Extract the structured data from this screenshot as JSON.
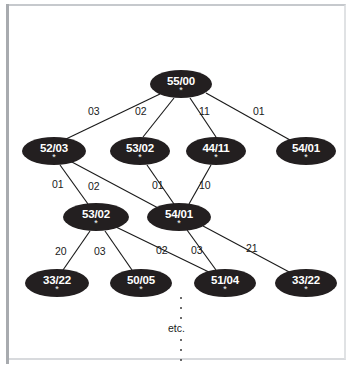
{
  "figure": {
    "type": "diagram",
    "subtype": "search-tree",
    "background_color": "#ffffff",
    "node_color": "#231f20",
    "node_text_color": "#ffffff",
    "edge_color": "#1a1a1a",
    "frame_color": "#b9bcc0"
  },
  "annotations": {
    "etc": "etc.",
    "node_marker": "*"
  },
  "nodes": [
    {
      "id": "n0",
      "label": "55/00",
      "marker": "*",
      "level": 0,
      "cx": 181,
      "cy": 84,
      "rx": 31,
      "ry": 14
    },
    {
      "id": "n1",
      "label": "52/03",
      "marker": "*",
      "level": 1,
      "cx": 54,
      "cy": 151,
      "rx": 32,
      "ry": 14
    },
    {
      "id": "n2",
      "label": "53/02",
      "marker": "*",
      "level": 1,
      "cx": 140,
      "cy": 151,
      "rx": 30,
      "ry": 14
    },
    {
      "id": "n3",
      "label": "44/11",
      "marker": "*",
      "level": 1,
      "cx": 216,
      "cy": 151,
      "rx": 30,
      "ry": 14
    },
    {
      "id": "n4",
      "label": "54/01",
      "marker": "*",
      "level": 1,
      "cx": 306,
      "cy": 151,
      "rx": 30,
      "ry": 14
    },
    {
      "id": "n5",
      "label": "53/02",
      "marker": "*",
      "level": 2,
      "cx": 96,
      "cy": 217,
      "rx": 33,
      "ry": 14
    },
    {
      "id": "n6",
      "label": "54/01",
      "marker": "*",
      "level": 2,
      "cx": 179,
      "cy": 217,
      "rx": 32,
      "ry": 14
    },
    {
      "id": "n7",
      "label": "33/22",
      "marker": "*",
      "level": 3,
      "cx": 57,
      "cy": 283,
      "rx": 32,
      "ry": 14
    },
    {
      "id": "n8",
      "label": "50/05",
      "marker": "*",
      "level": 3,
      "cx": 141,
      "cy": 283,
      "rx": 31,
      "ry": 14
    },
    {
      "id": "n9",
      "label": "51/04",
      "marker": "*",
      "level": 3,
      "cx": 225,
      "cy": 283,
      "rx": 31,
      "ry": 14
    },
    {
      "id": "n10",
      "label": "33/22",
      "marker": "*",
      "level": 3,
      "cx": 306,
      "cy": 283,
      "rx": 31,
      "ry": 14
    }
  ],
  "edges": [
    {
      "from": "n0",
      "to": "n1",
      "label": "03",
      "x1": 160,
      "y1": 94,
      "x2": 66,
      "y2": 139,
      "lx": 95,
      "ly": 111
    },
    {
      "from": "n0",
      "to": "n2",
      "label": "02",
      "x1": 174,
      "y1": 98,
      "x2": 143,
      "y2": 137,
      "lx": 142,
      "ly": 111
    },
    {
      "from": "n0",
      "to": "n3",
      "label": "11",
      "x1": 190,
      "y1": 98,
      "x2": 216,
      "y2": 137,
      "lx": 205,
      "ly": 111
    },
    {
      "from": "n0",
      "to": "n4",
      "label": "01",
      "x1": 206,
      "y1": 93,
      "x2": 290,
      "y2": 140,
      "lx": 259,
      "ly": 111
    },
    {
      "from": "n1",
      "to": "n5",
      "label": "01",
      "x1": 60,
      "y1": 165,
      "x2": 88,
      "y2": 204,
      "lx": 59,
      "ly": 184
    },
    {
      "from": "n1",
      "to": "n6",
      "label": "02",
      "x1": 70,
      "y1": 161,
      "x2": 160,
      "y2": 209,
      "lx": 95,
      "ly": 186
    },
    {
      "from": "n2",
      "to": "n6",
      "label": "01",
      "x1": 147,
      "y1": 165,
      "x2": 174,
      "y2": 204,
      "lx": 159,
      "ly": 185
    },
    {
      "from": "n3",
      "to": "n6",
      "label": "10",
      "x1": 211,
      "y1": 165,
      "x2": 189,
      "y2": 204,
      "lx": 205,
      "ly": 185
    },
    {
      "from": "n5",
      "to": "n7",
      "label": "20",
      "x1": 90,
      "y1": 231,
      "x2": 63,
      "y2": 270,
      "lx": 62,
      "ly": 251
    },
    {
      "from": "n5",
      "to": "n8",
      "label": "03",
      "x1": 105,
      "y1": 231,
      "x2": 132,
      "y2": 270,
      "lx": 101,
      "ly": 251
    },
    {
      "from": "n5",
      "to": "n9",
      "label": "02",
      "x1": 116,
      "y1": 227,
      "x2": 213,
      "y2": 274,
      "lx": 163,
      "ly": 250
    },
    {
      "from": "n6",
      "to": "n9",
      "label": "03",
      "x1": 187,
      "y1": 230,
      "x2": 216,
      "y2": 270,
      "lx": 198,
      "ly": 250
    },
    {
      "from": "n6",
      "to": "n10",
      "label": "21",
      "x1": 203,
      "y1": 226,
      "x2": 293,
      "y2": 274,
      "lx": 253,
      "ly": 248
    }
  ],
  "continuation": {
    "dots_above": 3,
    "dots_below": 3,
    "label": "etc.",
    "x": 180
  }
}
